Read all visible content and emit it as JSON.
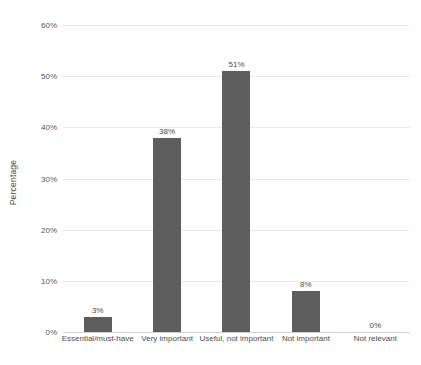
{
  "chart_data": {
    "type": "bar",
    "title": "",
    "xlabel": "",
    "ylabel": "Percentage",
    "categories": [
      "Essential/must-have",
      "Very important",
      "Useful, not important",
      "Not important",
      "Not relevant"
    ],
    "values": [
      3,
      38,
      51,
      8,
      0
    ],
    "value_labels": [
      "3%",
      "38%",
      "51%",
      "8%",
      "0%"
    ],
    "ylim": [
      0,
      60
    ],
    "ytick_values": [
      0,
      10,
      20,
      30,
      40,
      50,
      60
    ],
    "ytick_labels": [
      "0%",
      "10%",
      "20%",
      "30%",
      "40%",
      "50%",
      "60%"
    ],
    "grid": true,
    "legend": false,
    "series": [
      {
        "name": "Percentage",
        "values": [
          3,
          38,
          51,
          8,
          0
        ]
      }
    ],
    "colors": {
      "bar": "#5d5d5d",
      "gridline": "#e8e8e8",
      "axis": "#d4d4d4",
      "text": "#4a4a4a",
      "background": "#ffffff"
    }
  }
}
